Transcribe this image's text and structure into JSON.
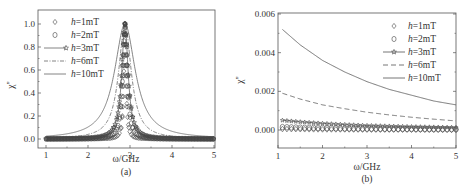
{
  "chart_data": [
    {
      "panel": "(a)",
      "type": "line",
      "title": "",
      "xlabel": "ω/GHz",
      "ylabel": "χ''",
      "xlim": [
        0.85,
        5
      ],
      "ylim": [
        -0.1,
        1.1
      ],
      "x_ticks": [
        "1",
        "2",
        "3",
        "4",
        "5"
      ],
      "y_ticks": [
        "0.0",
        "0.2",
        "0.4",
        "0.6",
        "0.8",
        "1.0"
      ],
      "grid": false,
      "legend_position": "upper left",
      "legend": [
        "h=1mT",
        "h=2mT",
        "h=3mT",
        "h=6mT",
        "h=10mT"
      ],
      "resonance_x": 2.88,
      "series": [
        {
          "name": "h=1mT",
          "style": "diamond markers",
          "peak_y": 1.0,
          "half_width": 0.03
        },
        {
          "name": "h=2mT",
          "style": "circle markers",
          "peak_y": 1.0,
          "half_width": 0.06
        },
        {
          "name": "h=3mT",
          "style": "line with star markers",
          "peak_y": 1.0,
          "half_width": 0.09
        },
        {
          "name": "h=6mT",
          "style": "dash-dot line",
          "peak_y": 1.0,
          "half_width": 0.18
        },
        {
          "name": "h=10mT",
          "style": "solid line",
          "peak_y": 1.0,
          "half_width": 0.3
        }
      ]
    },
    {
      "panel": "(b)",
      "type": "line",
      "title": "",
      "xlabel": "ω/GHz",
      "ylabel": "χ''",
      "xlim": [
        1,
        5
      ],
      "ylim": [
        -0.001,
        0.006
      ],
      "x_ticks": [
        "1",
        "2",
        "3",
        "4",
        "5"
      ],
      "y_ticks": [
        "0.000",
        "0.002",
        "0.004",
        "0.006"
      ],
      "grid": false,
      "legend_position": "upper right",
      "legend": [
        "h=1mT",
        "h=2mT",
        "h=3mT",
        "h=6mT",
        "h=10mT"
      ],
      "x": [
        1.1,
        1.5,
        2.0,
        2.5,
        3.0,
        3.5,
        4.0,
        4.5,
        5.0
      ],
      "series": [
        {
          "name": "h=1mT",
          "style": "diamond markers",
          "values": [
            5e-05,
            4e-05,
            3e-05,
            3e-05,
            2e-05,
            2e-05,
            2e-05,
            2e-05,
            1e-05
          ]
        },
        {
          "name": "h=2mT",
          "style": "circle markers",
          "values": [
            0.00015,
            0.00012,
            0.0001,
            8e-05,
            7e-05,
            6e-05,
            5e-05,
            4e-05,
            4e-05
          ]
        },
        {
          "name": "h=3mT",
          "style": "line with star markers",
          "values": [
            0.0005,
            0.00042,
            0.00034,
            0.00028,
            0.00023,
            0.0002,
            0.00017,
            0.00015,
            0.00013
          ]
        },
        {
          "name": "h=6mT",
          "style": "dashed line",
          "values": [
            0.0019,
            0.0016,
            0.0013,
            0.0011,
            0.00092,
            0.00078,
            0.00066,
            0.00056,
            0.00047
          ]
        },
        {
          "name": "h=10mT",
          "style": "solid line",
          "values": [
            0.0052,
            0.0044,
            0.0036,
            0.003,
            0.0025,
            0.0021,
            0.0018,
            0.0015,
            0.0013
          ]
        }
      ]
    }
  ],
  "panel_a": {
    "caption": "(a)",
    "xlabel": "ω/GHz",
    "ylabel": "χ''",
    "x_ticks": [
      "1",
      "2",
      "3",
      "4",
      "5"
    ],
    "y_ticks": [
      "0.0",
      "0.2",
      "0.4",
      "0.6",
      "0.8",
      "1.0"
    ],
    "legend": [
      "h=1mT",
      "h=2mT",
      "h=3mT",
      "h=6mT",
      "h=10mT"
    ]
  },
  "panel_b": {
    "caption": "(b)",
    "xlabel": "ω/GHz",
    "ylabel": "χ''",
    "x_ticks": [
      "1",
      "2",
      "3",
      "4",
      "5"
    ],
    "y_ticks": [
      "0.000",
      "0.002",
      "0.004",
      "0.006"
    ],
    "legend": [
      "h=1mT",
      "h=2mT",
      "h=3mT",
      "h=6mT",
      "h=10mT"
    ]
  },
  "colors": {
    "axis": "#555555",
    "line": "#666666",
    "marker": "#444444"
  }
}
